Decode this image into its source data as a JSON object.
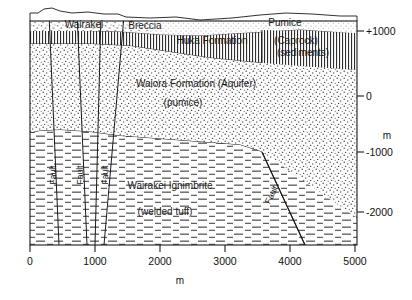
{
  "figure": {
    "type": "geological-cross-section"
  },
  "axes": {
    "x": {
      "label": "m",
      "ticks": [
        "0",
        "1000",
        "2000",
        "3000",
        "4000",
        "5000"
      ],
      "tick_values": [
        0,
        1000,
        2000,
        3000,
        4000,
        5000
      ],
      "range": [
        0,
        5500
      ]
    },
    "y": {
      "label": "m",
      "ticks": [
        "+1000",
        "0",
        "-1000",
        "-2000"
      ],
      "tick_values": [
        1000,
        0,
        -1000,
        -2000
      ],
      "range": [
        -2600,
        1350
      ]
    }
  },
  "formations": [
    {
      "id": "wairakei-breccia",
      "name": "Wairakei",
      "name2": "Breccia"
    },
    {
      "id": "pumice",
      "name": "Pumice"
    },
    {
      "id": "huka",
      "name": "Huka Formation"
    },
    {
      "id": "caprock",
      "name": "(Caprock)",
      "name2": "(sediments)"
    },
    {
      "id": "waiora",
      "name": "Waiora Formation (Aquifer)",
      "name2": "(pumice)"
    },
    {
      "id": "ignimbrite",
      "name": "Wairakei Ignimbrite",
      "name2": "(welded tuff)"
    }
  ],
  "faults": [
    {
      "id": "fault-1",
      "label": "Fault"
    },
    {
      "id": "fault-2",
      "label": "Fault"
    },
    {
      "id": "fault-3",
      "label": "Fault"
    },
    {
      "id": "fault-4",
      "label": "Fault"
    }
  ],
  "colors": {
    "line": "#1a1a1a",
    "text": "#111111",
    "background": "#ffffff",
    "stipple": "#555555",
    "dash": "#444444"
  }
}
